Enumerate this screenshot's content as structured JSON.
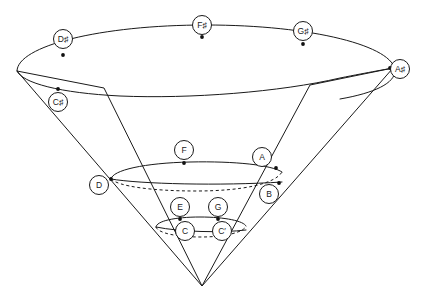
{
  "diagram": {
    "type": "geometric-cone-diagram",
    "background_color": "#ffffff",
    "stroke_color": "#1a1a1a",
    "apex": {
      "x": 202,
      "y": 286
    },
    "rings": [
      {
        "name": "outer-ring",
        "cx": 206,
        "cy": 56,
        "rx": 189,
        "ry": 32
      },
      {
        "name": "second-ring",
        "cx": 200,
        "cy": 79,
        "rx": 150,
        "ry": 26
      },
      {
        "name": "middle-ring",
        "cx": 198,
        "cy": 163,
        "rx": 92,
        "ry": 16
      },
      {
        "name": "inner-ring",
        "cx": 200,
        "cy": 219,
        "rx": 54,
        "ry": 10
      }
    ],
    "nodes": [
      {
        "id": "Dsharp",
        "label": "D♯",
        "x": 63,
        "y": 39,
        "dot_x": 63,
        "dot_y": 55,
        "ring": "outer-ring"
      },
      {
        "id": "Fsharp",
        "label": "F♯",
        "x": 202,
        "y": 25,
        "dot_x": 202,
        "dot_y": 37,
        "ring": "outer-ring"
      },
      {
        "id": "Gsharp",
        "label": "G♯",
        "x": 303,
        "y": 31,
        "dot_x": 303,
        "dot_y": 44,
        "ring": "outer-ring"
      },
      {
        "id": "Asharp",
        "label": "A♯",
        "x": 400,
        "y": 69,
        "dot_x": 390,
        "dot_y": 68,
        "ring": "outer-ring"
      },
      {
        "id": "Csharp",
        "label": "C♯",
        "x": 58,
        "y": 102,
        "dot_x": 58,
        "dot_y": 89,
        "ring": "second-ring"
      },
      {
        "id": "F",
        "label": "F",
        "x": 184,
        "y": 150,
        "dot_x": 184,
        "dot_y": 163,
        "ring": "middle-ring"
      },
      {
        "id": "A",
        "label": "A",
        "x": 262,
        "y": 157,
        "dot_x": 276,
        "dot_y": 168,
        "ring": "middle-ring"
      },
      {
        "id": "D",
        "label": "D",
        "x": 99,
        "y": 185,
        "dot_x": 111,
        "dot_y": 179,
        "ring": "middle-ring"
      },
      {
        "id": "B",
        "label": "B",
        "x": 269,
        "y": 194,
        "dot_x": 279,
        "dot_y": 183,
        "ring": "middle-ring"
      },
      {
        "id": "E",
        "label": "E",
        "x": 180,
        "y": 207,
        "dot_x": 180,
        "dot_y": 219,
        "ring": "inner-ring"
      },
      {
        "id": "G",
        "label": "G",
        "x": 218,
        "y": 207,
        "dot_x": 218,
        "dot_y": 219,
        "ring": "inner-ring"
      },
      {
        "id": "C",
        "label": "C",
        "x": 185,
        "y": 231,
        "dot_x": 178,
        "dot_y": 228,
        "ring": "inner-ring"
      },
      {
        "id": "Cprime",
        "label": "C′",
        "x": 222,
        "y": 231,
        "dot_x": 215,
        "dot_y": 228,
        "ring": "inner-ring"
      }
    ],
    "note_sequence": [
      "C",
      "C♯",
      "D",
      "D♯",
      "E",
      "F",
      "F♯",
      "G",
      "G♯",
      "A",
      "A♯",
      "B",
      "C′"
    ]
  }
}
